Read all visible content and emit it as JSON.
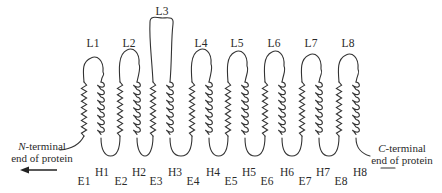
{
  "figure": {
    "stroke_color": "#333333",
    "background": "#ffffff"
  },
  "loops": [
    {
      "label": "L1",
      "x": 93,
      "top": 58,
      "label_y": 37
    },
    {
      "label": "L2",
      "x": 129,
      "top": 50,
      "label_y": 37
    },
    {
      "label": "L3",
      "x": 162,
      "top": 18,
      "label_y": 5
    },
    {
      "label": "L4",
      "x": 201,
      "top": 50,
      "label_y": 37
    },
    {
      "label": "L5",
      "x": 237,
      "top": 52,
      "label_y": 37
    },
    {
      "label": "L6",
      "x": 274,
      "top": 52,
      "label_y": 37
    },
    {
      "label": "L7",
      "x": 311,
      "top": 55,
      "label_y": 37
    },
    {
      "label": "L8",
      "x": 348,
      "top": 55,
      "label_y": 37
    }
  ],
  "segments_E": [
    {
      "label": "E1",
      "x": 84,
      "y": 175
    },
    {
      "label": "E2",
      "x": 121,
      "y": 175
    },
    {
      "label": "E3",
      "x": 156,
      "y": 175
    },
    {
      "label": "E4",
      "x": 193,
      "y": 175
    },
    {
      "label": "E5",
      "x": 231,
      "y": 175
    },
    {
      "label": "E6",
      "x": 267,
      "y": 175
    },
    {
      "label": "E7",
      "x": 305,
      "y": 175
    },
    {
      "label": "E8",
      "x": 341,
      "y": 175
    }
  ],
  "segments_H": [
    {
      "label": "H1",
      "x": 102,
      "y": 166
    },
    {
      "label": "H2",
      "x": 139,
      "y": 166
    },
    {
      "label": "H3",
      "x": 175,
      "y": 166
    },
    {
      "label": "H4",
      "x": 213,
      "y": 166
    },
    {
      "label": "H5",
      "x": 249,
      "y": 166
    },
    {
      "label": "H6",
      "x": 287,
      "y": 166
    },
    {
      "label": "H7",
      "x": 323,
      "y": 166
    },
    {
      "label": "H8",
      "x": 360,
      "y": 166
    }
  ],
  "n_terminal": {
    "italic": "N",
    "line1_rest": "-terminal",
    "line2": "end of protein"
  },
  "c_terminal": {
    "italic": "C",
    "line1_rest": "-terminal",
    "line2": "end of protein"
  }
}
